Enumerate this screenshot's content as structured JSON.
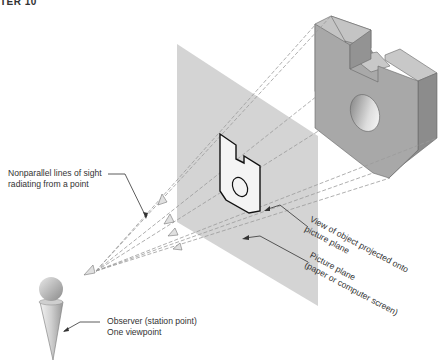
{
  "header": {
    "chapter_fragment": "TER 10"
  },
  "diagram": {
    "labels": {
      "lines_of_sight": [
        "Nonparallel lines of sight",
        "radiating from a point"
      ],
      "observer": [
        "Observer (station point)",
        "One viewpoint"
      ],
      "view_projected": [
        "View of object projected onto",
        "picture plane"
      ],
      "picture_plane": [
        "Picture plane",
        "(paper or computer screen)"
      ]
    },
    "elements": [
      "observer-figure",
      "lines-of-sight",
      "picture-plane",
      "projected-view",
      "3d-object"
    ],
    "colors": {
      "plane": "#d4d4d4",
      "object_front": "#a9a9a9",
      "object_top": "#c8c8c8",
      "object_side": "#8c8c8c",
      "sight_line": "#9a9a9a",
      "text": "#333333"
    }
  }
}
